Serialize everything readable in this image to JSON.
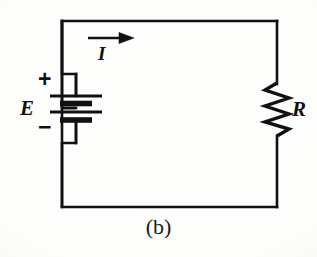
{
  "figure": {
    "domain": "Diagram",
    "kind": "electrical-schematic",
    "caption": "(b)",
    "width": 317,
    "height": 257,
    "background_color": "#fdfdfc",
    "ink_color": "#111111"
  },
  "labels": {
    "source": "E",
    "current": "I",
    "resistor": "R",
    "positive_terminal": "+",
    "negative_terminal": "−",
    "caption": "(b)"
  },
  "components": [
    {
      "id": "battery",
      "name": "dc-source-battery",
      "symbol": "battery-multicell",
      "label": "E",
      "terminal_markers": [
        "+",
        "−"
      ],
      "orientation": "vertical",
      "cells": 2,
      "plate_count": 4,
      "position": {
        "x": 76,
        "y": 108
      }
    },
    {
      "id": "resistor",
      "name": "resistor",
      "symbol": "zigzag",
      "label": "R",
      "orientation": "vertical",
      "zigzag_peaks": 4,
      "position": {
        "x": 277,
        "y": 108
      }
    },
    {
      "id": "current-arrow",
      "name": "current-direction-arrow",
      "symbol": "arrow-right",
      "label": "I",
      "direction": "right",
      "meaning": "conventional current flows clockwise",
      "position": {
        "x": 110,
        "y": 38
      }
    }
  ],
  "loop": {
    "name": "circuit-loop",
    "shape": "rectangle",
    "left": 62,
    "top": 21,
    "right": 277,
    "bottom": 207,
    "stroke_width": 2.6
  },
  "geometry": {
    "battery_plates": [
      {
        "index": 0,
        "kind": "long-thin",
        "half_width": 26,
        "y": 96,
        "thickness": 2.6
      },
      {
        "index": 1,
        "kind": "short-thick",
        "half_width": 16,
        "y": 103,
        "thickness": 5.2
      },
      {
        "index": 2,
        "kind": "long-thin",
        "half_width": 26,
        "y": 112,
        "thickness": 2.6
      },
      {
        "index": 3,
        "kind": "short-thick",
        "half_width": 16,
        "y": 120,
        "thickness": 5.2
      }
    ],
    "resistor_path": "M 277 84 L 266 91 L 288 99 L 266 107 L 288 115 L 266 123 L 288 130 L 277 136 L 277 207",
    "arrow_shaft": {
      "x1": 88,
      "y1": 38,
      "x2": 124,
      "y2": 38
    },
    "arrow_head": {
      "tip_x": 134,
      "tip_y": 38,
      "back_x": 120,
      "half_height": 6
    }
  }
}
